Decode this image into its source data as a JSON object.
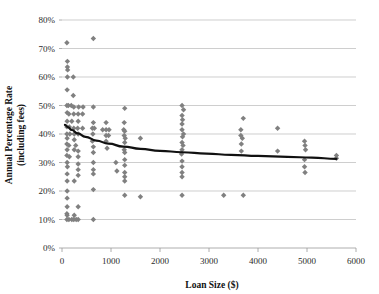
{
  "chart_data": {
    "type": "scatter",
    "title": "",
    "xlabel": "Loan Size ($)",
    "ylabel": "Annual Percentage Rate (including fees)",
    "xlim": [
      0,
      6000
    ],
    "ylim": [
      0,
      0.8
    ],
    "xticks": [
      0,
      1000,
      2000,
      3000,
      4000,
      5000,
      6000
    ],
    "xtick_labels": [
      "0",
      "1000",
      "2000",
      "3000",
      "4000",
      "5000",
      "6000"
    ],
    "yticks": [
      0,
      0.1,
      0.2,
      0.3,
      0.4,
      0.5,
      0.6,
      0.7,
      0.8
    ],
    "ytick_labels": [
      "0%",
      "10%",
      "20%",
      "30%",
      "40%",
      "50%",
      "60%",
      "70%",
      "80%"
    ],
    "grid": true,
    "legend": "none",
    "marker_color": "#808080",
    "marker_shape": "diamond",
    "trendline_color": "#111111",
    "series": [
      {
        "name": "Loans",
        "points": [
          [
            100,
            0.72
          ],
          [
            640,
            0.735
          ],
          [
            110,
            0.655
          ],
          [
            110,
            0.635
          ],
          [
            115,
            0.625
          ],
          [
            110,
            0.6
          ],
          [
            230,
            0.6
          ],
          [
            105,
            0.555
          ],
          [
            230,
            0.535
          ],
          [
            100,
            0.5
          ],
          [
            130,
            0.5
          ],
          [
            190,
            0.5
          ],
          [
            240,
            0.495
          ],
          [
            340,
            0.495
          ],
          [
            430,
            0.495
          ],
          [
            640,
            0.495
          ],
          [
            1280,
            0.49
          ],
          [
            2450,
            0.5
          ],
          [
            2480,
            0.485
          ],
          [
            105,
            0.475
          ],
          [
            140,
            0.47
          ],
          [
            240,
            0.47
          ],
          [
            330,
            0.47
          ],
          [
            420,
            0.47
          ],
          [
            2450,
            0.465
          ],
          [
            2460,
            0.45
          ],
          [
            3700,
            0.455
          ],
          [
            105,
            0.445
          ],
          [
            200,
            0.445
          ],
          [
            330,
            0.445
          ],
          [
            640,
            0.44
          ],
          [
            900,
            0.44
          ],
          [
            1270,
            0.44
          ],
          [
            2450,
            0.435
          ],
          [
            100,
            0.425
          ],
          [
            150,
            0.425
          ],
          [
            240,
            0.42
          ],
          [
            320,
            0.42
          ],
          [
            420,
            0.42
          ],
          [
            620,
            0.42
          ],
          [
            660,
            0.42
          ],
          [
            830,
            0.415
          ],
          [
            900,
            0.415
          ],
          [
            960,
            0.415
          ],
          [
            1260,
            0.415
          ],
          [
            1280,
            0.41
          ],
          [
            2450,
            0.415
          ],
          [
            2480,
            0.4
          ],
          [
            3650,
            0.415
          ],
          [
            100,
            0.4
          ],
          [
            160,
            0.4
          ],
          [
            250,
            0.4
          ],
          [
            330,
            0.4
          ],
          [
            630,
            0.4
          ],
          [
            900,
            0.395
          ],
          [
            950,
            0.395
          ],
          [
            1270,
            0.395
          ],
          [
            1290,
            0.385
          ],
          [
            1600,
            0.385
          ],
          [
            2460,
            0.39
          ],
          [
            3650,
            0.395
          ],
          [
            3680,
            0.385
          ],
          [
            4400,
            0.42
          ],
          [
            105,
            0.385
          ],
          [
            250,
            0.38
          ],
          [
            620,
            0.375
          ],
          [
            900,
            0.375
          ],
          [
            1280,
            0.37
          ],
          [
            2450,
            0.37
          ],
          [
            2470,
            0.36
          ],
          [
            3660,
            0.365
          ],
          [
            4950,
            0.375
          ],
          [
            4960,
            0.36
          ],
          [
            4970,
            0.345
          ],
          [
            100,
            0.365
          ],
          [
            140,
            0.36
          ],
          [
            280,
            0.36
          ],
          [
            640,
            0.355
          ],
          [
            920,
            0.35
          ],
          [
            1270,
            0.345
          ],
          [
            2450,
            0.345
          ],
          [
            3660,
            0.34
          ],
          [
            4400,
            0.34
          ],
          [
            5600,
            0.315
          ],
          [
            105,
            0.345
          ],
          [
            250,
            0.345
          ],
          [
            330,
            0.34
          ],
          [
            640,
            0.335
          ],
          [
            1280,
            0.335
          ],
          [
            2440,
            0.33
          ],
          [
            5600,
            0.325
          ],
          [
            100,
            0.325
          ],
          [
            150,
            0.32
          ],
          [
            330,
            0.32
          ],
          [
            640,
            0.3
          ],
          [
            1100,
            0.3
          ],
          [
            1280,
            0.31
          ],
          [
            2450,
            0.305
          ],
          [
            4950,
            0.31
          ],
          [
            105,
            0.3
          ],
          [
            330,
            0.295
          ],
          [
            640,
            0.275
          ],
          [
            1280,
            0.29
          ],
          [
            2450,
            0.285
          ],
          [
            4950,
            0.285
          ],
          [
            110,
            0.285
          ],
          [
            330,
            0.275
          ],
          [
            640,
            0.26
          ],
          [
            1120,
            0.27
          ],
          [
            1280,
            0.265
          ],
          [
            2450,
            0.265
          ],
          [
            4960,
            0.265
          ],
          [
            105,
            0.26
          ],
          [
            330,
            0.255
          ],
          [
            1280,
            0.25
          ],
          [
            2450,
            0.25
          ],
          [
            105,
            0.235
          ],
          [
            250,
            0.235
          ],
          [
            1280,
            0.235
          ],
          [
            105,
            0.2
          ],
          [
            640,
            0.205
          ],
          [
            1280,
            0.185
          ],
          [
            2450,
            0.185
          ],
          [
            3300,
            0.185
          ],
          [
            3700,
            0.185
          ],
          [
            1600,
            0.18
          ],
          [
            105,
            0.175
          ],
          [
            105,
            0.145
          ],
          [
            330,
            0.145
          ],
          [
            100,
            0.12
          ],
          [
            105,
            0.115
          ],
          [
            250,
            0.115
          ],
          [
            100,
            0.1
          ],
          [
            140,
            0.1
          ],
          [
            200,
            0.1
          ],
          [
            240,
            0.1
          ],
          [
            290,
            0.1
          ],
          [
            330,
            0.1
          ],
          [
            640,
            0.1
          ]
        ]
      }
    ],
    "trendline": {
      "type": "logarithmic",
      "description": "fitted declining curve",
      "points": [
        [
          60,
          0.432
        ],
        [
          120,
          0.424
        ],
        [
          200,
          0.414
        ],
        [
          320,
          0.402
        ],
        [
          480,
          0.39
        ],
        [
          700,
          0.377
        ],
        [
          950,
          0.366
        ],
        [
          1250,
          0.356
        ],
        [
          1600,
          0.348
        ],
        [
          2000,
          0.341
        ],
        [
          2450,
          0.336
        ],
        [
          2950,
          0.331
        ],
        [
          3450,
          0.327
        ],
        [
          4000,
          0.323
        ],
        [
          4600,
          0.32
        ],
        [
          5100,
          0.317
        ],
        [
          5600,
          0.313
        ]
      ]
    }
  }
}
